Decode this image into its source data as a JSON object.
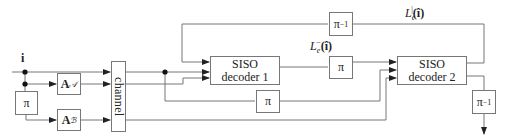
{
  "diagram": {
    "input": {
      "label": "i"
    },
    "blocks": {
      "interleaver_input": {
        "label": "π"
      },
      "encoder_a": {
        "main": "A",
        "sub": "𝒜"
      },
      "encoder_b": {
        "main": "A",
        "sub": "ℬ"
      },
      "channel": {
        "label": "channel"
      },
      "decoder1": {
        "line1": "SISO",
        "line2": "decoder 1"
      },
      "decoder2": {
        "line1": "SISO",
        "line2": "decoder 2"
      },
      "interleaver_mid": {
        "label": "π"
      },
      "interleaver_bottom": {
        "label": "π"
      },
      "deinterleaver_feedback": {
        "base": "π",
        "exp": "−1"
      },
      "deinterleaver_output": {
        "base": "π",
        "exp": "−1"
      }
    },
    "signals": {
      "extrinsic_1": {
        "base": "L",
        "sub": "e",
        "sup": "−",
        "arg": "(î)"
      },
      "extrinsic_2": {
        "base": "L",
        "sub": "e",
        "sup": "|",
        "arg": "(î)"
      }
    },
    "colors": {
      "line": "#777777",
      "text": "#222222",
      "background": "#ffffff"
    }
  }
}
